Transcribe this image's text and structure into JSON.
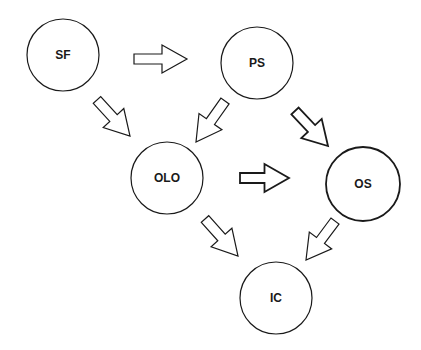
{
  "diagram": {
    "type": "flow",
    "nodes": [
      {
        "id": "SF",
        "label": "SF",
        "cx": 63,
        "cy": 55,
        "r": 36,
        "stroke_width": 1.2
      },
      {
        "id": "PS",
        "label": "PS",
        "cx": 257,
        "cy": 63,
        "r": 36,
        "stroke_width": 1.2
      },
      {
        "id": "OLO",
        "label": "OLO",
        "cx": 167,
        "cy": 178,
        "r": 36,
        "stroke_width": 1.2
      },
      {
        "id": "OS",
        "label": "OS",
        "cx": 363,
        "cy": 184,
        "r": 37,
        "stroke_width": 1.8
      },
      {
        "id": "IC",
        "label": "IC",
        "cx": 276,
        "cy": 298,
        "r": 36,
        "stroke_width": 1.2
      }
    ],
    "edges": [
      {
        "from": "SF",
        "to": "PS",
        "x1": 134,
        "y1": 59,
        "x2": 187,
        "y2": 59,
        "stroke_width": 1.2
      },
      {
        "from": "SF",
        "to": "OLO",
        "x1": 97,
        "y1": 100,
        "x2": 130,
        "y2": 136,
        "stroke_width": 1.2
      },
      {
        "from": "PS",
        "to": "OLO",
        "x1": 225,
        "y1": 101,
        "x2": 196,
        "y2": 142,
        "stroke_width": 1.2
      },
      {
        "from": "PS",
        "to": "OS",
        "x1": 295,
        "y1": 111,
        "x2": 328,
        "y2": 146,
        "stroke_width": 1.8
      },
      {
        "from": "OLO",
        "to": "OS",
        "x1": 240,
        "y1": 178,
        "x2": 289,
        "y2": 178,
        "stroke_width": 1.8
      },
      {
        "from": "OLO",
        "to": "IC",
        "x1": 205,
        "y1": 219,
        "x2": 238,
        "y2": 256,
        "stroke_width": 1.2
      },
      {
        "from": "OS",
        "to": "IC",
        "x1": 335,
        "y1": 221,
        "x2": 306,
        "y2": 260,
        "stroke_width": 1.2
      }
    ],
    "colors": {
      "stroke": "#1a1a1a",
      "fill": "#ffffff",
      "background": "#ffffff"
    }
  }
}
